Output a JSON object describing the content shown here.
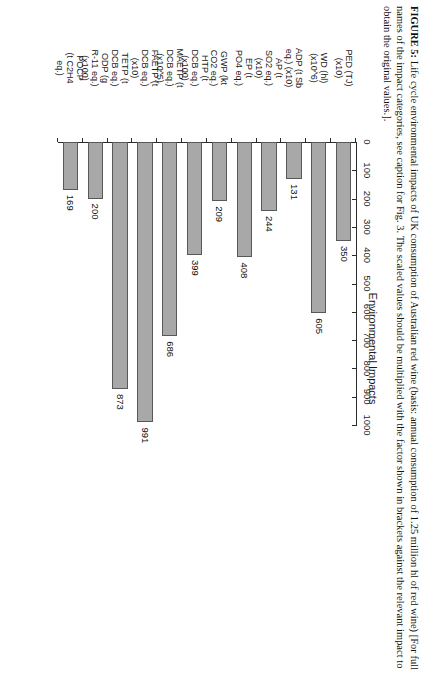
{
  "caption": {
    "label": "FIGURE 5:",
    "text": " Life cycle environmental impacts of UK consumption of Australian red wine (basis: annual consumption of 1.25 million hl of red wine) [For full names of the impact categories, see caption for Fig. 3. The scaled values should be multiplied with the factor shown in brackets against the relevant impact to obtain the original values.]."
  },
  "chart_data": {
    "type": "bar",
    "orientation": "vertical",
    "title": "",
    "xlabel": "",
    "ylabel": "Environmental Impacts",
    "ylim": [
      0,
      1000
    ],
    "yticks": [
      "0",
      "100",
      "200",
      "300",
      "400",
      "500",
      "600",
      "700",
      "800",
      "900",
      "1000"
    ],
    "grid": false,
    "legend": false,
    "bar_color": "#a8a8a8",
    "bar_edge_color": "#585858",
    "categories": [
      "PED (TJ) (x10)",
      "WD (hl) (x10^6)",
      "ADP (t Sb eq.) (x10)",
      "AP (t SO2 eq.) (x10)",
      "EP (t PO4 eq.)",
      "GWP (kt CO2 eq.)",
      "HTP (t DCB eq.) (x100)",
      "MAETP (t DCB eq.) (x10^5)",
      "FAETP (t DCB eq.) (x10)",
      "TETP (t DCB eq.)",
      "ODP (g R-11 eq.) (x100)",
      "POCP (t C2H4 eq.)"
    ],
    "category_lines": [
      [
        "PED (TJ)",
        "(x10)"
      ],
      [
        "WD (hl)",
        "(x10^6)"
      ],
      [
        "ADP (t Sb",
        "eq.) (x10)"
      ],
      [
        "AP (t",
        "SO2 eq.)",
        "(x10)"
      ],
      [
        "EP (t",
        "PO4 eq.)"
      ],
      [
        "GWP (kt",
        "CO2 eq.)"
      ],
      [
        "HTP (t",
        "DCB eq.)",
        "(x100)"
      ],
      [
        "MAETP (t",
        "DCB eq.)",
        "(x10^5)"
      ],
      [
        "FAETP (t",
        "DCB eq.)",
        "(x10)"
      ],
      [
        "TETP (t",
        "DCB eq.)"
      ],
      [
        "ODP (g",
        "R-11 eq.)",
        "(x100)"
      ],
      [
        "POCP",
        "(t C2H4",
        "eq.)"
      ]
    ],
    "values": [
      350,
      605,
      131,
      244,
      408,
      209,
      399,
      686,
      991,
      873,
      200,
      169
    ],
    "value_labels": [
      "350",
      "605",
      "131",
      "244",
      "408",
      "209",
      "399",
      "686",
      "991",
      "873",
      "200",
      "169"
    ]
  }
}
